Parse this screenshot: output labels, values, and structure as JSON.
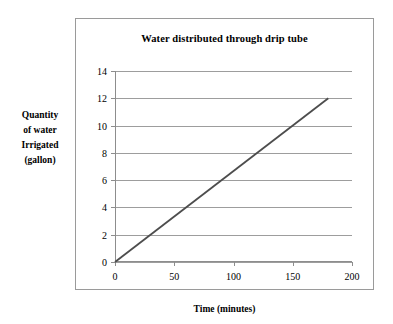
{
  "chart_data": {
    "type": "line",
    "title": "Water distributed through drip tube",
    "xlabel": "Time (minutes)",
    "ylabel": "Quantity of water Irrigated (gallon)",
    "ylabel_lines": [
      "Quantity",
      "of water",
      "Irrigated",
      "(gallon)"
    ],
    "xlim": [
      0,
      200
    ],
    "ylim": [
      0,
      14
    ],
    "xticks": [
      0,
      50,
      100,
      150,
      200
    ],
    "yticks": [
      0,
      2,
      4,
      6,
      8,
      10,
      12,
      14
    ],
    "xtick_labels": [
      "0",
      "50",
      "100",
      "150",
      "200"
    ],
    "ytick_labels": [
      "0",
      "2",
      "4",
      "6",
      "8",
      "10",
      "12",
      "14"
    ],
    "grid": "horizontal",
    "legend": "none",
    "series": [
      {
        "name": "Water distributed",
        "color": "#4d4d4d",
        "x": [
          0,
          180
        ],
        "values": [
          0,
          12
        ],
        "points": [
          [
            0,
            0
          ],
          [
            180,
            12
          ]
        ],
        "slope_gallons_per_minute": 0.0667
      }
    ]
  },
  "colors": {
    "frame": "#9a9a9a",
    "gridline": "#9d9d9d",
    "axis": "#8d8d8d",
    "line": "#4d4d4d",
    "text": "#000000",
    "background": "#ffffff"
  }
}
